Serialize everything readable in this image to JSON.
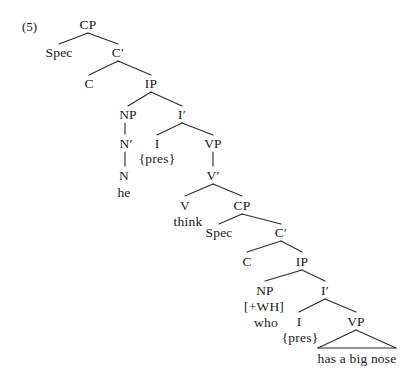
{
  "figure": {
    "example_number": "(5)",
    "sentence": "he think who has a big nose",
    "notation": "X-bar syntactic tree diagram"
  },
  "style": {
    "background": "#ffffff",
    "ink": "#1a1a1a",
    "line_color": "#2b2b2b"
  },
  "nodes": {
    "cp1": "CP",
    "spec1": "Spec",
    "cbar1": "C′",
    "c1": "C",
    "ip1": "IP",
    "np1": "NP",
    "ibar1": "I′",
    "nbar1": "N′",
    "i1": "I",
    "i1_feat": "{pres}",
    "vp1": "VP",
    "n1": "N",
    "n1_word": "he",
    "vbar1": "V′",
    "v1": "V",
    "v1_word": "think",
    "cp2": "CP",
    "spec2": "Spec",
    "cbar2": "C′",
    "c2": "C",
    "ip2": "IP",
    "np2": "NP",
    "np2_feat": "[+WH]",
    "np2_word": "who",
    "ibar2": "I′",
    "i2": "I",
    "i2_feat": "{pres}",
    "vp2": "VP",
    "vp2_phrase": "has a big nose"
  }
}
